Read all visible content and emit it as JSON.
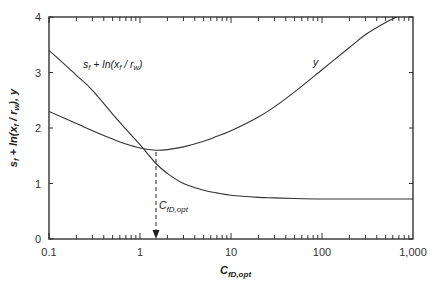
{
  "chart_data": {
    "type": "line",
    "title": "",
    "xlabel": "C_fD,opt",
    "ylabel": "s_f + ln(x_f/r_w), y",
    "xscale": "log",
    "xlim": [
      0.1,
      1000
    ],
    "ylim": [
      0,
      4
    ],
    "grid": false,
    "legend": "none (inline curve labels)",
    "x_ticks": [
      "0.1",
      "1",
      "10",
      "100",
      "1,000"
    ],
    "y_ticks": [
      "0",
      "1",
      "2",
      "3",
      "4"
    ],
    "series": [
      {
        "name": "s_f + ln(x_f/r_w)",
        "x": [
          0.1,
          0.2,
          0.3,
          0.5,
          0.7,
          1,
          1.5,
          2,
          3,
          5,
          7,
          10,
          20,
          30,
          50,
          100,
          300,
          1000
        ],
        "values": [
          3.4,
          2.95,
          2.68,
          2.25,
          1.98,
          1.7,
          1.36,
          1.18,
          1.0,
          0.88,
          0.83,
          0.79,
          0.75,
          0.74,
          0.73,
          0.72,
          0.72,
          0.72
        ]
      },
      {
        "name": "y",
        "x": [
          0.1,
          0.2,
          0.3,
          0.5,
          0.7,
          1,
          1.5,
          2,
          3,
          5,
          7,
          10,
          20,
          30,
          50,
          100,
          200,
          300,
          500,
          660
        ],
        "values": [
          2.3,
          2.08,
          1.95,
          1.8,
          1.71,
          1.64,
          1.6,
          1.61,
          1.66,
          1.76,
          1.85,
          1.95,
          2.2,
          2.38,
          2.65,
          3.05,
          3.45,
          3.68,
          3.9,
          4.0
        ]
      }
    ],
    "annotations": [
      {
        "text": "s_f + ln(x_f/r_w)",
        "x": 0.23,
        "y": 3.35
      },
      {
        "text": "y",
        "x": 80,
        "y": 3.15
      },
      {
        "text": "C_fD,opt",
        "x": 1.5,
        "y": 0.6,
        "arrow": "dashed vertical arrow from curve minimum (C≈1.5, ≈1.6) down to x-axis"
      }
    ]
  },
  "labels": {
    "y_axis_title": "s_f + ln(x_f/r_w), y",
    "x_axis_title": "C_fD,opt",
    "curve_a": "s_f + ln(x_f/r_w)",
    "curve_b": "y",
    "annotation": "C_fD,opt",
    "x_ticks": [
      "0.1",
      "1",
      "10",
      "100",
      "1,000"
    ],
    "y_ticks": [
      "0",
      "1",
      "2",
      "3",
      "4"
    ]
  }
}
